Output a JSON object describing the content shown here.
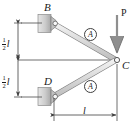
{
  "figure": {
    "colors": {
      "line": "#3f3f3f",
      "member_fill": "#d9d9d9",
      "member_edge": "#8c8c8c",
      "support_fill": "#c9c9c9",
      "support_edge": "#8a8a8a",
      "text": "#1a1a1a",
      "arrow": "#8a8a8a"
    },
    "joints": [
      {
        "id": "B",
        "label": "B",
        "x": 52,
        "y": 23
      },
      {
        "id": "D",
        "label": "D",
        "x": 52,
        "y": 97
      },
      {
        "id": "C",
        "label": "C",
        "x": 117,
        "y": 60
      }
    ],
    "members": [
      {
        "id": "BC",
        "from": "B",
        "to": "C",
        "area_label": "A"
      },
      {
        "id": "DC",
        "from": "D",
        "to": "C",
        "area_label": "A"
      }
    ],
    "load": {
      "label": "P",
      "direction": "down",
      "applied_at": "C"
    },
    "dimensions": [
      {
        "id": "upper-half-span",
        "orientation": "vertical",
        "numerator": "1",
        "denominator": "2",
        "symbol": "l",
        "text": "1/2 l"
      },
      {
        "id": "lower-half-span",
        "orientation": "vertical",
        "numerator": "1",
        "denominator": "2",
        "symbol": "l",
        "text": "1/2 l"
      },
      {
        "id": "horizontal-span",
        "orientation": "horizontal",
        "symbol": "l",
        "text": "l"
      }
    ],
    "area_badges": [
      {
        "id": "area-upper",
        "label": "A"
      },
      {
        "id": "area-lower",
        "label": "A"
      }
    ]
  }
}
